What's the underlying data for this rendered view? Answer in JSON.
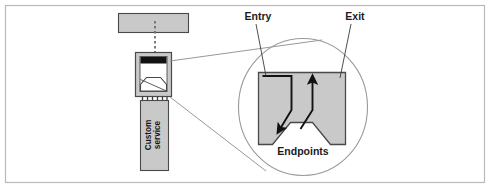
{
  "figure": {
    "title_visible": false,
    "width": 491,
    "height": 189,
    "background_color": "#ffffff",
    "frame": {
      "name": "figure-frame",
      "stroke_color": "#b9b9b9",
      "fill": "#ffffff"
    }
  },
  "labels": {
    "entry": "Entry",
    "exit": "Exit",
    "endpoints": "Endpoints",
    "custom_service_line1": "Custom",
    "custom_service_line2": "service"
  },
  "colors": {
    "shape_fill": "#c9c9c9",
    "shape_stroke": "#4a4a4a",
    "dark_bar": "#111111",
    "leader_line": "#8c8c8c",
    "circle_stroke": "#9a9a9a",
    "arrow": "#121212",
    "text": "#1b1b1b",
    "frame_stroke": "#b9b9b9",
    "canvas": "#ffffff"
  },
  "diagram": {
    "type": "callout-detail-diagram",
    "description_visible": false,
    "parts": [
      {
        "name": "top-module-rectangle",
        "shape": "rectangle",
        "fill": "#c9c9c9"
      },
      {
        "name": "dotted-connector-line",
        "shape": "dotted-vertical-line"
      },
      {
        "name": "connector-housing",
        "shape": "rectangle-with-notch",
        "fill": "#c9c9c9"
      },
      {
        "name": "connector-contact-bar",
        "shape": "bar",
        "fill": "#111111"
      },
      {
        "name": "connector-pins",
        "shape": "pin-lines",
        "count": 6
      },
      {
        "name": "custom-service-block",
        "shape": "vertical-rectangle",
        "fill": "#c9c9c9"
      },
      {
        "name": "magnifier-circle",
        "shape": "circle",
        "stroke": "#9a9a9a"
      },
      {
        "name": "magnified-endpoint-shape",
        "shape": "notched-rectangle",
        "fill": "#c9c9c9"
      },
      {
        "name": "entry-arrow",
        "shape": "polyline-arrow",
        "direction": "down-right"
      },
      {
        "name": "exit-arrow",
        "shape": "polyline-arrow",
        "direction": "up"
      },
      {
        "name": "callout-leader-line-top",
        "shape": "line"
      },
      {
        "name": "callout-leader-line-bottom",
        "shape": "line"
      }
    ]
  }
}
